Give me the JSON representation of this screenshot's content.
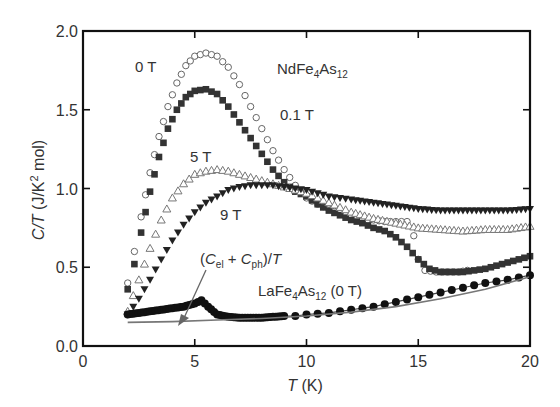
{
  "chart_data": {
    "type": "scatter",
    "title": "",
    "xlabel": "T (K)",
    "ylabel": "C/T (J/K^2 mol)",
    "xlim": [
      0,
      20
    ],
    "ylim": [
      0.0,
      2.0
    ],
    "x_ticks": [
      "0",
      "5",
      "10",
      "15",
      "20"
    ],
    "y_ticks": [
      "0.0",
      "0.5",
      "1.0",
      "1.5",
      "2.0"
    ],
    "grid": false,
    "legend": "inline annotations",
    "annotations": [
      {
        "text": "0 T",
        "x": 2.7,
        "y": 1.82
      },
      {
        "text": "NdFe4As12",
        "x": 8.8,
        "y": 1.74
      },
      {
        "text": "0.1 T",
        "x": 9.4,
        "y": 1.45
      },
      {
        "text": "5 T",
        "x": 4.8,
        "y": 1.18
      },
      {
        "text": "9 T",
        "x": 5.3,
        "y": 0.78
      },
      {
        "text": "(Cel + Cph)/T",
        "x": 5.5,
        "y": 0.58
      },
      {
        "text": "LaFe4As12 (0 T)",
        "x": 8.3,
        "y": 0.35
      }
    ],
    "series": [
      {
        "name": "0 T",
        "marker": "open-circle",
        "x": [
          2.0,
          2.3,
          2.6,
          3.0,
          3.4,
          3.8,
          4.2,
          4.6,
          5.0,
          5.5,
          6.0,
          6.5,
          7.0,
          7.5,
          8.0,
          8.5,
          9.0,
          9.5,
          10.0,
          10.5,
          11.0,
          11.5,
          12.0,
          12.5,
          13.0,
          13.5,
          14.0,
          14.5,
          14.8,
          15.0,
          15.3,
          15.8,
          16.3,
          16.8,
          17.2
        ],
        "y": [
          0.4,
          0.6,
          0.82,
          1.1,
          1.33,
          1.52,
          1.67,
          1.78,
          1.84,
          1.86,
          1.84,
          1.77,
          1.66,
          1.52,
          1.38,
          1.24,
          1.12,
          1.02,
          0.94,
          0.9,
          0.87,
          0.84,
          0.82,
          0.8,
          0.8,
          0.79,
          0.79,
          0.79,
          0.7,
          0.55,
          0.48,
          0.47,
          0.47,
          0.47,
          0.48
        ]
      },
      {
        "name": "0.1 T",
        "marker": "filled-square",
        "x": [
          2.0,
          2.3,
          2.6,
          3.0,
          3.4,
          3.8,
          4.2,
          4.6,
          5.0,
          5.5,
          6.0,
          6.5,
          7.0,
          7.5,
          8.0,
          8.5,
          9.0,
          9.5,
          10.0,
          10.5,
          11.0,
          11.5,
          12.0,
          12.5,
          13.0,
          13.5,
          14.0,
          14.5,
          15.0,
          15.5,
          16.0,
          16.5,
          17.0,
          17.5,
          18.0,
          18.5,
          19.0,
          19.5,
          20.0
        ],
        "y": [
          0.36,
          0.52,
          0.72,
          0.98,
          1.2,
          1.38,
          1.5,
          1.58,
          1.62,
          1.63,
          1.6,
          1.52,
          1.42,
          1.32,
          1.22,
          1.12,
          1.04,
          0.98,
          0.95,
          0.9,
          0.86,
          0.83,
          0.8,
          0.78,
          0.75,
          0.73,
          0.69,
          0.63,
          0.55,
          0.49,
          0.47,
          0.47,
          0.47,
          0.48,
          0.49,
          0.51,
          0.53,
          0.55,
          0.57
        ]
      },
      {
        "name": "5 T",
        "marker": "open-up-triangle",
        "x": [
          2.0,
          2.5,
          3.0,
          3.5,
          4.0,
          4.5,
          5.0,
          5.5,
          6.0,
          6.5,
          7.0,
          7.5,
          8.0,
          8.5,
          9.0,
          9.5,
          10.0,
          10.5,
          11.0,
          11.5,
          12.0,
          13.0,
          14.0,
          15.0,
          16.0,
          17.0,
          18.0,
          19.0,
          20.0
        ],
        "y": [
          0.22,
          0.42,
          0.62,
          0.8,
          0.94,
          1.03,
          1.09,
          1.11,
          1.12,
          1.11,
          1.09,
          1.07,
          1.05,
          1.03,
          1.01,
          0.99,
          0.97,
          0.94,
          0.91,
          0.88,
          0.85,
          0.81,
          0.78,
          0.75,
          0.74,
          0.73,
          0.74,
          0.74,
          0.76
        ]
      },
      {
        "name": "9 T",
        "marker": "filled-down-triangle",
        "x": [
          2.0,
          2.5,
          3.0,
          3.5,
          4.0,
          4.5,
          5.0,
          5.5,
          6.0,
          6.5,
          7.0,
          7.5,
          8.0,
          8.5,
          9.0,
          9.5,
          10.0,
          10.5,
          11.0,
          11.5,
          12.0,
          13.0,
          14.0,
          15.0,
          16.0,
          17.0,
          18.0,
          19.0,
          20.0
        ],
        "y": [
          0.2,
          0.3,
          0.42,
          0.55,
          0.67,
          0.77,
          0.85,
          0.91,
          0.95,
          0.99,
          1.01,
          1.02,
          1.02,
          1.02,
          1.01,
          1.0,
          0.99,
          0.97,
          0.95,
          0.94,
          0.93,
          0.91,
          0.89,
          0.87,
          0.86,
          0.86,
          0.86,
          0.86,
          0.87
        ]
      },
      {
        "name": "LaFe4As12 (0 T)",
        "marker": "filled-circle",
        "x": [
          2.0,
          2.5,
          3.0,
          3.5,
          4.0,
          4.5,
          5.0,
          5.3,
          5.6,
          6.0,
          6.5,
          7.0,
          7.5,
          8.0,
          8.5,
          9.0,
          9.5,
          10.0,
          10.5,
          11.0,
          11.5,
          12.0,
          12.5,
          13.0,
          14.0,
          15.0,
          16.0,
          17.0,
          18.0,
          19.0,
          20.0
        ],
        "y": [
          0.2,
          0.21,
          0.22,
          0.23,
          0.24,
          0.25,
          0.27,
          0.29,
          0.25,
          0.2,
          0.185,
          0.18,
          0.18,
          0.18,
          0.185,
          0.19,
          0.19,
          0.2,
          0.205,
          0.21,
          0.22,
          0.23,
          0.24,
          0.25,
          0.28,
          0.31,
          0.34,
          0.37,
          0.4,
          0.42,
          0.45
        ]
      },
      {
        "name": "(Cel + Cph)/T",
        "marker": "line",
        "x": [
          2.0,
          4.0,
          6.0,
          8.0,
          10.0,
          12.0,
          14.0,
          16.0,
          18.0,
          20.0
        ],
        "y": [
          0.15,
          0.155,
          0.165,
          0.175,
          0.19,
          0.215,
          0.25,
          0.3,
          0.36,
          0.44
        ]
      }
    ]
  },
  "labels": {
    "label_0T": "0 T",
    "label_compound_main": "NdFe",
    "label_compound_sub1": "4",
    "label_compound_mid": "As",
    "label_compound_sub2": "12",
    "label_01T": "0.1 T",
    "label_5T": "5 T",
    "label_9T": "9 T",
    "label_cel_open": "(",
    "label_cel_C1": "C",
    "label_cel_sub1": "el",
    "label_cel_plus": " + ",
    "label_cel_C2": "C",
    "label_cel_sub2": "ph",
    "label_cel_close": ")/",
    "label_cel_T": "T",
    "label_la_main": "LaFe",
    "label_la_sub1": "4",
    "label_la_mid": "As",
    "label_la_sub2": "12",
    "label_la_tail": " (0 T)",
    "xlabel_T": "T",
    "xlabel_unit": " (K)",
    "ylabel_CT": "C/T",
    "ylabel_unit_a": " (J/K",
    "ylabel_sup": "2",
    "ylabel_unit_b": " mol)"
  }
}
